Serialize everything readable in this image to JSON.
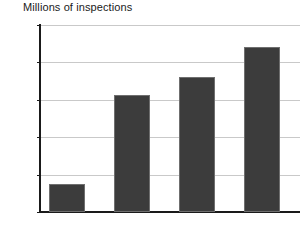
{
  "chart_data": {
    "type": "bar",
    "title": "Millions of inspections",
    "xlabel": "",
    "ylabel": "",
    "categories": [
      "1985",
      "1990",
      "1995",
      "1999"
    ],
    "values": [
      0.37,
      1.56,
      1.8,
      2.2
    ],
    "ylim": [
      0.0,
      2.5
    ],
    "yticks": [
      "0.0",
      "0.5",
      "1.0",
      "1.5",
      "2.0",
      "2.5"
    ],
    "ytick_values": [
      0.0,
      0.5,
      1.0,
      1.5,
      2.0,
      2.5
    ],
    "grid": true,
    "legend": false,
    "legend_position": "none",
    "bar_color": "#3c3c3c",
    "bar_edge_color": "#6f6f6f",
    "grid_color": "#c9c9c9",
    "axis_color": "#1a1a1a",
    "background_color": "#ffffff",
    "series": [
      {
        "name": "Millions of inspections",
        "values": [
          0.37,
          1.56,
          1.8,
          2.2
        ]
      }
    ]
  }
}
